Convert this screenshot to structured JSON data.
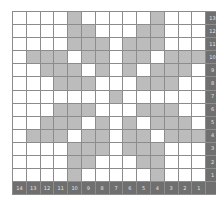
{
  "chart_data": {
    "type": "heatmap",
    "title": "",
    "columns": 14,
    "rows": 13,
    "column_labels": [
      "14",
      "13",
      "12",
      "11",
      "10",
      "9",
      "8",
      "7",
      "6",
      "5",
      "4",
      "3",
      "2",
      "1"
    ],
    "row_labels": [
      "13",
      "12",
      "11",
      "10",
      "9",
      "8",
      "7",
      "6",
      "5",
      "4",
      "3",
      "2",
      "1"
    ],
    "colors": {
      "filled": "#bcbcbc",
      "empty": "#ffffff",
      "label_bg": "#6f6f6f",
      "label_text": "#e6e6e6",
      "grid_line": "#8c8c8c"
    },
    "cells": [
      [
        0,
        0,
        0,
        0,
        1,
        0,
        0,
        0,
        0,
        0,
        1,
        0,
        0,
        0
      ],
      [
        0,
        0,
        0,
        0,
        1,
        1,
        0,
        0,
        0,
        1,
        1,
        0,
        0,
        0
      ],
      [
        0,
        0,
        0,
        0,
        1,
        1,
        1,
        0,
        1,
        1,
        1,
        0,
        0,
        0
      ],
      [
        0,
        1,
        1,
        1,
        0,
        1,
        1,
        0,
        1,
        1,
        0,
        1,
        1,
        1
      ],
      [
        0,
        0,
        1,
        1,
        1,
        0,
        1,
        0,
        1,
        0,
        1,
        1,
        1,
        0
      ],
      [
        0,
        0,
        0,
        1,
        1,
        1,
        0,
        0,
        0,
        1,
        1,
        1,
        0,
        0
      ],
      [
        0,
        0,
        0,
        0,
        0,
        0,
        0,
        1,
        0,
        0,
        0,
        0,
        0,
        0
      ],
      [
        0,
        0,
        0,
        1,
        1,
        1,
        0,
        0,
        0,
        1,
        1,
        1,
        0,
        0
      ],
      [
        0,
        0,
        1,
        1,
        1,
        0,
        1,
        0,
        1,
        0,
        1,
        1,
        1,
        0
      ],
      [
        0,
        1,
        1,
        1,
        0,
        1,
        1,
        0,
        1,
        1,
        0,
        1,
        1,
        1
      ],
      [
        0,
        0,
        0,
        0,
        1,
        1,
        1,
        0,
        1,
        1,
        1,
        0,
        0,
        0
      ],
      [
        0,
        0,
        0,
        0,
        1,
        1,
        0,
        0,
        0,
        1,
        1,
        0,
        0,
        0
      ],
      [
        0,
        0,
        0,
        0,
        1,
        0,
        0,
        0,
        0,
        0,
        1,
        0,
        0,
        0
      ]
    ]
  }
}
